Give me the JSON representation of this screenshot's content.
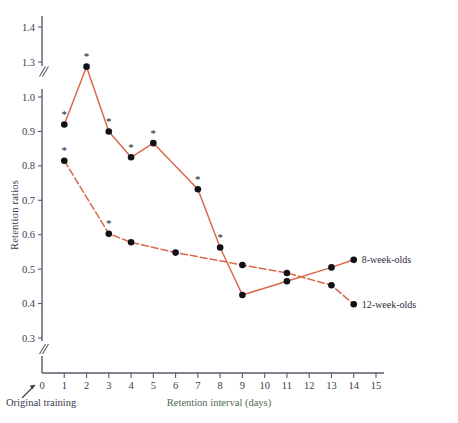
{
  "chart_data": {
    "type": "line",
    "title": "",
    "xlabel": "Retention interval (days)",
    "ylabel": "Retention ratios",
    "xlim": [
      0,
      15
    ],
    "ylim": [
      0.3,
      1.4
    ],
    "grid": false,
    "legend_position": "right",
    "axis_note_left": "Original training",
    "y_axis_break": true,
    "y_axis_break_between": [
      1.0,
      1.3
    ],
    "y_axis_break_bottom": true,
    "xticks": [
      "0",
      "1",
      "2",
      "3",
      "4",
      "5",
      "6",
      "7",
      "8",
      "9",
      "10",
      "11",
      "12",
      "13",
      "14",
      "15"
    ],
    "yticks": [
      "0.3",
      "0.4",
      "0.5",
      "0.6",
      "0.7",
      "0.8",
      "0.9",
      "1.0",
      "1.3",
      "1.4"
    ],
    "x": [
      1,
      2,
      3,
      4,
      5,
      6,
      7,
      8,
      9,
      11,
      13,
      14
    ],
    "series": [
      {
        "name": "8-week-olds",
        "style": "solid",
        "color": "#d9684c",
        "points": [
          {
            "x": 1,
            "y": 0.92,
            "significant": true
          },
          {
            "x": 2,
            "y": 1.26,
            "significant": true
          },
          {
            "x": 3,
            "y": 0.9,
            "significant": true
          },
          {
            "x": 4,
            "y": 0.825,
            "significant": true
          },
          {
            "x": 5,
            "y": 0.866,
            "significant": true
          },
          {
            "x": 7,
            "y": 0.732,
            "significant": true
          },
          {
            "x": 8,
            "y": 0.563,
            "significant": true
          },
          {
            "x": 9,
            "y": 0.425,
            "significant": false
          },
          {
            "x": 11,
            "y": 0.465,
            "significant": false
          },
          {
            "x": 13,
            "y": 0.505,
            "significant": false
          },
          {
            "x": 14,
            "y": 0.527,
            "significant": false
          }
        ]
      },
      {
        "name": "12-week-olds",
        "style": "dashed",
        "color": "#d9684c",
        "points": [
          {
            "x": 1,
            "y": 0.815,
            "significant": true
          },
          {
            "x": 3,
            "y": 0.603,
            "significant": true
          },
          {
            "x": 4,
            "y": 0.578,
            "significant": false
          },
          {
            "x": 6,
            "y": 0.548,
            "significant": false
          },
          {
            "x": 9,
            "y": 0.512,
            "significant": false
          },
          {
            "x": 11,
            "y": 0.489,
            "significant": false
          },
          {
            "x": 13,
            "y": 0.453,
            "significant": false
          },
          {
            "x": 14,
            "y": 0.398,
            "significant": false
          }
        ]
      }
    ],
    "legend": [
      {
        "label": "8-week-olds"
      },
      {
        "label": "12-week-olds"
      }
    ],
    "significance_marker": "*"
  }
}
